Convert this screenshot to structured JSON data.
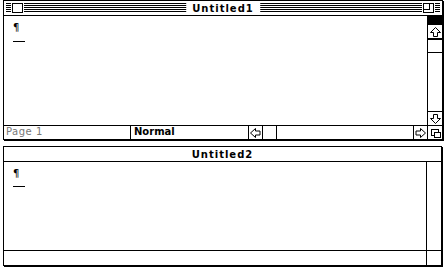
{
  "windows": [
    {
      "title": "Untitled1",
      "active": true,
      "content": {
        "paragraph_mark": "¶"
      },
      "status": {
        "page": "Page 1",
        "style": "Normal"
      }
    },
    {
      "title": "Untitled2",
      "active": false,
      "content": {
        "paragraph_mark": "¶"
      }
    }
  ],
  "icons": {
    "close": "close-box-icon",
    "zoom": "zoom-box-icon",
    "up": "up-arrow-icon",
    "down": "down-arrow-icon",
    "left": "left-arrow-icon",
    "right": "right-arrow-icon",
    "grow": "size-box-icon"
  }
}
